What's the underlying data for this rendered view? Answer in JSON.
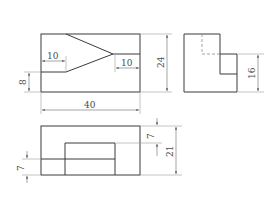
{
  "drawing": {
    "type": "three-view orthographic projection",
    "front_view": {
      "dims": {
        "width": "40",
        "height": "24",
        "notch_left_depth": "10",
        "notch_right_depth": "10",
        "bottom_offset": "8"
      }
    },
    "side_view": {
      "dims": {
        "step_height": "16"
      }
    },
    "top_view": {
      "dims": {
        "total_depth": "21",
        "top_offset": "7",
        "bottom_offset": "7"
      }
    }
  },
  "colors": {
    "line": "#3a3a3a",
    "hidden_line": "#8a8a8a",
    "dimension": "#6a6a6a",
    "background": "#ffffff"
  }
}
